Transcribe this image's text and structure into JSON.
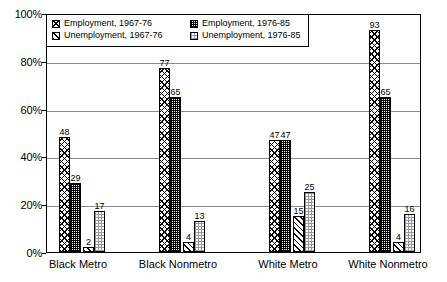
{
  "chart_data": {
    "type": "bar",
    "title": "",
    "xlabel": "",
    "ylabel": "",
    "ylim": [
      0,
      100
    ],
    "ytick_labels": [
      "0%",
      "20%",
      "40%",
      "60%",
      "80%",
      "100%"
    ],
    "ytick_values": [
      0,
      20,
      40,
      60,
      80,
      100
    ],
    "grid": true,
    "legend_position": "top-left",
    "categories": [
      "Black Metro",
      "Black Nonmetro",
      "White Metro",
      "White Nonmetro"
    ],
    "series": [
      {
        "name": "Employment, 1967-76",
        "pattern": "cross-hatch",
        "values": [
          48,
          77,
          47,
          93
        ]
      },
      {
        "name": "Employment, 1976-85",
        "pattern": "dense-stipple",
        "values": [
          29,
          65,
          47,
          65
        ]
      },
      {
        "name": "Unemployment, 1967-76",
        "pattern": "diagonal-lines",
        "values": [
          2,
          4,
          15,
          4
        ]
      },
      {
        "name": "Unemployment, 1976-85",
        "pattern": "light-stipple",
        "values": [
          17,
          13,
          25,
          16
        ]
      }
    ]
  },
  "legend": {
    "items": [
      {
        "label": "Employment, 1967-76"
      },
      {
        "label": "Employment, 1976-85"
      },
      {
        "label": "Unemployment, 1967-76"
      },
      {
        "label": "Unemployment, 1976-85"
      }
    ]
  }
}
